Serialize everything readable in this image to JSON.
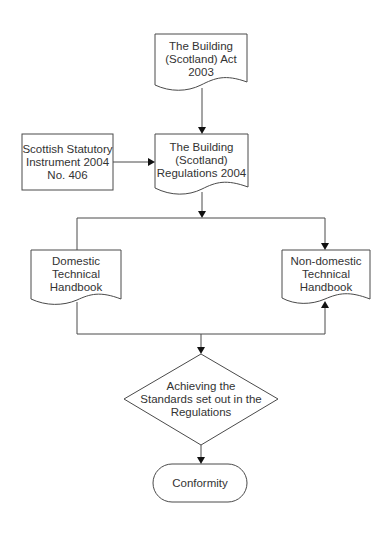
{
  "diagram": {
    "colors": {
      "stroke": "#4a4a4a",
      "text": "#333333",
      "arrowhead": "#111111",
      "background": "#ffffff"
    },
    "nodes": {
      "act": {
        "type": "document",
        "label": "The Building\n(Scotland) Act\n2003"
      },
      "ssi": {
        "type": "process",
        "label": "Scottish Statutory\nInstrument 2004\nNo. 406"
      },
      "regs": {
        "type": "document",
        "label": "The Building\n(Scotland)\nRegulations 2004"
      },
      "domestic": {
        "type": "document",
        "label": "Domestic\nTechnical\nHandbook"
      },
      "nondomestic": {
        "type": "document",
        "label": "Non-domestic\nTechnical\nHandbook"
      },
      "achieving": {
        "type": "decision",
        "label": "Achieving the\nStandards set out in the\nRegulations"
      },
      "conformity": {
        "type": "terminator",
        "label": "Conformity"
      }
    },
    "edges": [
      {
        "from": "act",
        "to": "regs"
      },
      {
        "from": "ssi",
        "to": "regs"
      },
      {
        "from": "regs",
        "to": "domestic"
      },
      {
        "from": "regs",
        "to": "nondomestic"
      },
      {
        "from": "domestic",
        "to": "achieving"
      },
      {
        "from": "achieving",
        "to": "nondomestic"
      },
      {
        "from": "achieving",
        "to": "conformity"
      }
    ]
  }
}
